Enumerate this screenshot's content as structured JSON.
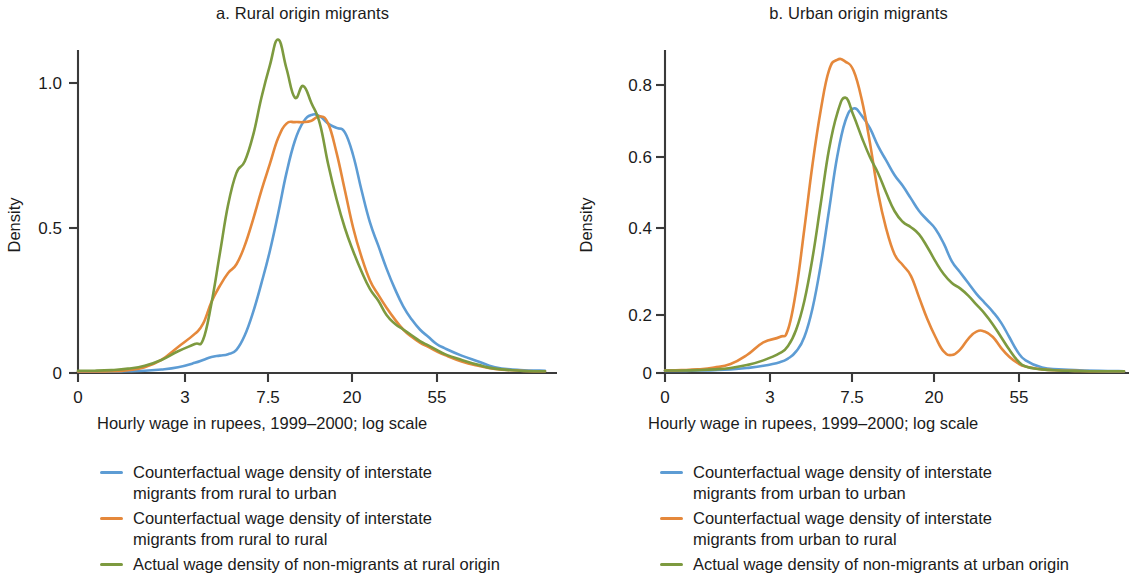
{
  "figure": {
    "background": "#ffffff",
    "colors": {
      "blue": "#5D9CD4",
      "orange": "#E5883B",
      "green": "#7D9A3F",
      "axis": "#3a3a3a",
      "text": "#1b1b1b"
    }
  },
  "panels": [
    {
      "id": "a",
      "title": "a. Rural origin migrants",
      "xlabel": "Hourly wage in rupees, 1999–2000; log scale",
      "ylabel": "Density",
      "legend": [
        {
          "color": "#5D9CD4",
          "label": "Counterfactual wage density of interstate\nmigrants from rural to urban"
        },
        {
          "color": "#E5883B",
          "label": "Counterfactual wage density of interstate\nmigrants from rural to rural"
        },
        {
          "color": "#7D9A3F",
          "label": "Actual wage density of non-migrants at rural origin"
        }
      ]
    },
    {
      "id": "b",
      "title": "b. Urban origin migrants",
      "xlabel": "Hourly wage in rupees, 1999–2000; log scale",
      "ylabel": "Density",
      "legend": [
        {
          "color": "#5D9CD4",
          "label": "Counterfactual wage density of interstate\nmigrants from urban to urban"
        },
        {
          "color": "#E5883B",
          "label": "Counterfactual wage density of interstate\nmigrants from urban to rural"
        },
        {
          "color": "#7D9A3F",
          "label": "Actual wage density of non-migrants at urban origin"
        }
      ]
    }
  ],
  "chart_data": [
    {
      "type": "line",
      "panel": "a",
      "title": "a. Rural origin migrants",
      "xlabel": "Hourly wage in rupees, 1999–2000; log scale",
      "ylabel": "Density",
      "xticks": [
        "0",
        "3",
        "7.5",
        "20",
        "55"
      ],
      "xtick_positions": [
        0,
        3,
        7.5,
        20,
        55
      ],
      "yticks": [
        "0",
        "0.5",
        "1.0"
      ],
      "ylim": [
        0,
        1.18
      ],
      "xlim_units": [
        0,
        5.6
      ],
      "xscale": "log",
      "grid": false,
      "legend_position": "below",
      "x": [
        0.0,
        0.2,
        0.4,
        0.6,
        0.8,
        1.0,
        1.2,
        1.4,
        1.5,
        1.6,
        1.7,
        1.8,
        1.9,
        2.0,
        2.1,
        2.2,
        2.3,
        2.4,
        2.5,
        2.6,
        2.7,
        2.8,
        2.9,
        3.0,
        3.1,
        3.2,
        3.3,
        3.4,
        3.5,
        3.6,
        3.7,
        3.8,
        3.9,
        4.0,
        4.1,
        4.2,
        4.3,
        4.4,
        4.6,
        4.8,
        5.0,
        5.3,
        5.6
      ],
      "series": [
        {
          "name": "Counterfactual wage density of interstate migrants from rural to urban",
          "color": "#5D9CD4",
          "values": [
            0.005,
            0.005,
            0.005,
            0.006,
            0.008,
            0.012,
            0.02,
            0.035,
            0.045,
            0.055,
            0.06,
            0.065,
            0.08,
            0.13,
            0.21,
            0.31,
            0.42,
            0.55,
            0.69,
            0.8,
            0.865,
            0.89,
            0.885,
            0.86,
            0.845,
            0.83,
            0.75,
            0.63,
            0.52,
            0.44,
            0.36,
            0.29,
            0.23,
            0.185,
            0.15,
            0.125,
            0.1,
            0.085,
            0.06,
            0.04,
            0.02,
            0.01,
            0.008
          ]
        },
        {
          "name": "Counterfactual wage density of interstate migrants from rural to rural",
          "color": "#E5883B",
          "values": [
            0.005,
            0.005,
            0.006,
            0.01,
            0.02,
            0.045,
            0.09,
            0.135,
            0.17,
            0.245,
            0.3,
            0.345,
            0.375,
            0.44,
            0.53,
            0.63,
            0.72,
            0.81,
            0.86,
            0.865,
            0.865,
            0.87,
            0.885,
            0.86,
            0.76,
            0.63,
            0.5,
            0.4,
            0.32,
            0.27,
            0.225,
            0.185,
            0.15,
            0.125,
            0.105,
            0.09,
            0.075,
            0.062,
            0.04,
            0.025,
            0.014,
            0.008,
            0.006
          ]
        },
        {
          "name": "Actual wage density of non-migrants at rural origin",
          "color": "#7D9A3F",
          "values": [
            0.008,
            0.008,
            0.01,
            0.015,
            0.025,
            0.045,
            0.075,
            0.1,
            0.115,
            0.24,
            0.41,
            0.58,
            0.69,
            0.73,
            0.82,
            0.95,
            1.06,
            1.15,
            1.05,
            0.95,
            0.99,
            0.93,
            0.86,
            0.72,
            0.6,
            0.5,
            0.42,
            0.35,
            0.29,
            0.25,
            0.2,
            0.17,
            0.15,
            0.13,
            0.11,
            0.095,
            0.08,
            0.065,
            0.045,
            0.028,
            0.015,
            0.008,
            0.006
          ]
        }
      ]
    },
    {
      "type": "line",
      "panel": "b",
      "title": "b. Urban origin migrants",
      "xlabel": "Hourly wage in rupees, 1999–2000; log scale",
      "ylabel": "Density",
      "xticks": [
        "0",
        "3",
        "7.5",
        "20",
        "55"
      ],
      "xtick_positions": [
        0,
        3,
        7.5,
        20,
        55
      ],
      "yticks": [
        "0",
        "0.2",
        "0.4",
        "0.6",
        "0.8"
      ],
      "ylim": [
        0,
        0.92
      ],
      "xlim_units": [
        0,
        5.6
      ],
      "xscale": "log",
      "grid": false,
      "legend_position": "below",
      "x": [
        0.0,
        0.2,
        0.4,
        0.6,
        0.8,
        1.0,
        1.2,
        1.4,
        1.5,
        1.6,
        1.7,
        1.8,
        1.9,
        2.0,
        2.1,
        2.2,
        2.3,
        2.4,
        2.5,
        2.6,
        2.7,
        2.8,
        2.9,
        3.0,
        3.1,
        3.2,
        3.3,
        3.4,
        3.5,
        3.6,
        3.7,
        3.8,
        3.9,
        4.0,
        4.1,
        4.2,
        4.3,
        4.4,
        4.6,
        4.8,
        5.0,
        5.3,
        5.6
      ],
      "series": [
        {
          "name": "Counterfactual wage density of interstate migrants from urban to urban",
          "color": "#5D9CD4",
          "values": [
            0.006,
            0.006,
            0.007,
            0.008,
            0.01,
            0.014,
            0.02,
            0.03,
            0.04,
            0.06,
            0.1,
            0.18,
            0.3,
            0.45,
            0.6,
            0.7,
            0.735,
            0.715,
            0.68,
            0.63,
            0.59,
            0.55,
            0.52,
            0.485,
            0.45,
            0.425,
            0.4,
            0.36,
            0.31,
            0.28,
            0.25,
            0.22,
            0.195,
            0.17,
            0.14,
            0.1,
            0.06,
            0.035,
            0.015,
            0.01,
            0.008,
            0.006,
            0.005
          ]
        },
        {
          "name": "Counterfactual wage density of interstate migrants from urban to rural",
          "color": "#E5883B",
          "values": [
            0.007,
            0.008,
            0.01,
            0.015,
            0.025,
            0.05,
            0.085,
            0.1,
            0.12,
            0.23,
            0.4,
            0.58,
            0.73,
            0.84,
            0.87,
            0.865,
            0.84,
            0.76,
            0.64,
            0.5,
            0.4,
            0.33,
            0.3,
            0.27,
            0.21,
            0.15,
            0.1,
            0.06,
            0.05,
            0.065,
            0.095,
            0.115,
            0.115,
            0.1,
            0.07,
            0.045,
            0.028,
            0.018,
            0.01,
            0.007,
            0.006,
            0.005,
            0.005
          ]
        },
        {
          "name": "Actual wage density of non-migrants at urban origin",
          "color": "#7D9A3F",
          "values": [
            0.007,
            0.007,
            0.008,
            0.01,
            0.014,
            0.022,
            0.035,
            0.055,
            0.075,
            0.12,
            0.2,
            0.32,
            0.47,
            0.62,
            0.72,
            0.765,
            0.715,
            0.655,
            0.6,
            0.555,
            0.5,
            0.45,
            0.42,
            0.405,
            0.385,
            0.35,
            0.31,
            0.275,
            0.25,
            0.235,
            0.215,
            0.19,
            0.165,
            0.135,
            0.1,
            0.065,
            0.035,
            0.018,
            0.01,
            0.007,
            0.006,
            0.005,
            0.005
          ]
        }
      ]
    }
  ]
}
